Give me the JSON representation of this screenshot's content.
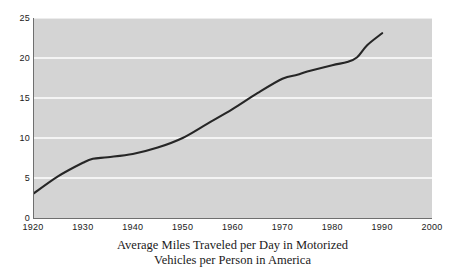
{
  "figure": {
    "caption_line_1": "Average Miles Traveled per Day in Motorized",
    "caption_line_2": "Vehicles per Person in America"
  },
  "colors": {
    "plot_background": "#d4d4d4",
    "gridline": "#ffffff",
    "line": "#262626",
    "axis": "#6f6f6f",
    "text": "#1a1a1a",
    "page_background": "#ffffff"
  },
  "chart_data": {
    "type": "line",
    "title": "Average Miles Traveled per Day in Motorized Vehicles per Person in America",
    "xlabel": "",
    "ylabel": "",
    "xlim": [
      1920,
      2000
    ],
    "ylim": [
      0,
      25
    ],
    "xticks": [
      1920,
      1930,
      1940,
      1950,
      1960,
      1970,
      1980,
      1990,
      2000
    ],
    "xtick_labels": [
      "1920",
      "1930",
      "1940",
      "1950",
      "1960",
      "1970",
      "1980",
      "1990",
      "2000"
    ],
    "yticks": [
      0,
      5,
      10,
      15,
      20,
      25
    ],
    "ytick_labels": [
      "0",
      "5",
      "10",
      "15",
      "20",
      "25"
    ],
    "grid": "horizontal",
    "gridline_values": [
      5,
      10,
      15,
      20,
      25
    ],
    "legend": null,
    "series": [
      {
        "name": "Average miles traveled per day",
        "x": [
          1920,
          1925,
          1930,
          1932,
          1935,
          1940,
          1945,
          1950,
          1955,
          1960,
          1965,
          1970,
          1973,
          1975,
          1980,
          1983,
          1985,
          1987,
          1990
        ],
        "values": [
          3.0,
          5.2,
          6.9,
          7.4,
          7.6,
          8.0,
          8.8,
          10.0,
          11.8,
          13.6,
          15.6,
          17.4,
          17.9,
          18.3,
          19.1,
          19.5,
          20.1,
          21.6,
          23.1
        ]
      }
    ]
  }
}
